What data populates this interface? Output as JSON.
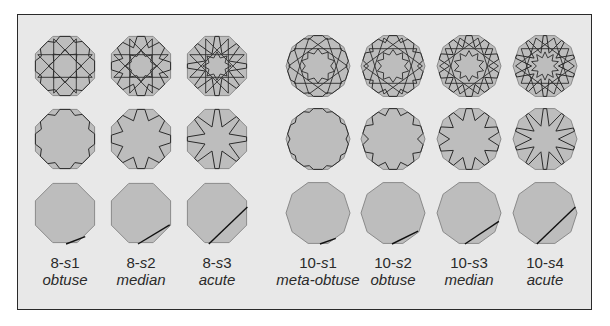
{
  "figure": {
    "background": "#e8e8e8",
    "border_color": "#2a2a2a",
    "tile_fill": "#bdbdbd",
    "tile_stroke": "#8a8a8a",
    "line_color": "#2b2b2b",
    "rows": [
      "full-pattern",
      "star-outline",
      "construction-line"
    ],
    "groups": [
      {
        "fold": 8,
        "columns": [
          {
            "id": "8-s1",
            "prefix": "8-",
            "s": "s",
            "index": "1",
            "name": "obtuse",
            "cx": 65,
            "star_depth": 0.12,
            "line_t": 0.1
          },
          {
            "id": "8-s2",
            "prefix": "8-",
            "s": "s",
            "index": "2",
            "name": "median",
            "cx": 141,
            "star_depth": 0.32,
            "line_t": 0.3
          },
          {
            "id": "8-s3",
            "prefix": "8-",
            "s": "s",
            "index": "3",
            "name": "acute",
            "cx": 217,
            "star_depth": 0.55,
            "line_t": 0.55
          }
        ]
      },
      {
        "fold": 10,
        "columns": [
          {
            "id": "10-s1",
            "prefix": "10-",
            "s": "s",
            "index": "1",
            "name": "meta-obtuse",
            "cx": 318,
            "star_depth": 0.06,
            "line_t": 0.06
          },
          {
            "id": "10-s2",
            "prefix": "10-",
            "s": "s",
            "index": "2",
            "name": "obtuse",
            "cx": 393,
            "star_depth": 0.18,
            "line_t": 0.2
          },
          {
            "id": "10-s3",
            "prefix": "10-",
            "s": "s",
            "index": "3",
            "name": "median",
            "cx": 469,
            "star_depth": 0.35,
            "line_t": 0.35
          },
          {
            "id": "10-s4",
            "prefix": "10-",
            "s": "s",
            "index": "4",
            "name": "acute",
            "cx": 545,
            "star_depth": 0.55,
            "line_t": 0.55
          }
        ]
      }
    ],
    "row_centers": [
      66,
      139,
      213
    ],
    "radius": 32,
    "label_top": 254
  }
}
